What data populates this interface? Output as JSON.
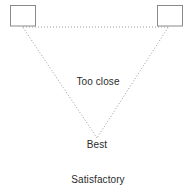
{
  "diagram": {
    "type": "speaker-placement-listening-triangle",
    "canvas": {
      "width": 191,
      "height": 193,
      "background": "#ffffff"
    },
    "colors": {
      "line": "#9a9a9a",
      "box_stroke": "#8a8a8a",
      "box_fill": "#ffffff",
      "text": "#2b2b2b"
    },
    "speakers": [
      {
        "name": "left-speaker",
        "x": 10,
        "y": 5,
        "width": 25,
        "height": 21
      },
      {
        "name": "right-speaker",
        "x": 157,
        "y": 5,
        "width": 25,
        "height": 21
      }
    ],
    "lines": [
      {
        "name": "baseline",
        "x1": 23,
        "y1": 27,
        "x2": 168,
        "y2": 27,
        "style": "dotted"
      },
      {
        "name": "left-axis",
        "x1": 23,
        "y1": 27,
        "x2": 97,
        "y2": 138,
        "style": "dotted"
      },
      {
        "name": "right-axis",
        "x1": 168,
        "y1": 27,
        "x2": 97,
        "y2": 138,
        "style": "dotted"
      }
    ],
    "labels": {
      "too_close": "Too close",
      "best": "Best",
      "satisfactory": "Satisfactory"
    }
  }
}
